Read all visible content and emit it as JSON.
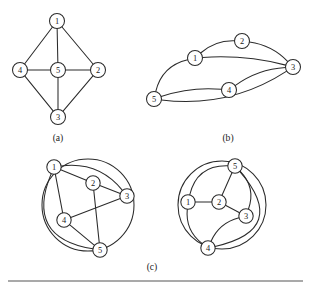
{
  "figure": {
    "background_color": "#ffffff",
    "ink_color": "#2b2b2b",
    "rule": {
      "x1": 8,
      "y1": 281,
      "x2": 303,
      "y2": 281,
      "color": "#555555"
    },
    "captions": [
      {
        "id": "caption-a",
        "text": "(a)",
        "x": 58,
        "y": 137
      },
      {
        "id": "caption-b",
        "text": "(b)",
        "x": 228,
        "y": 137
      },
      {
        "id": "caption-c",
        "text": "(c)",
        "x": 152,
        "y": 266
      }
    ],
    "graphs": [
      {
        "id": "graph-a",
        "caption": "(a)",
        "layout": "planar-quadrilateral-with-center",
        "nodes": [
          {
            "label": "1",
            "x": 57,
            "y": 21,
            "r": 7.5
          },
          {
            "label": "2",
            "x": 98,
            "y": 70,
            "r": 7.5
          },
          {
            "label": "3",
            "x": 58,
            "y": 117,
            "r": 7.5
          },
          {
            "label": "4",
            "x": 20,
            "y": 70,
            "r": 7.5
          },
          {
            "label": "5",
            "x": 58,
            "y": 70,
            "r": 7.5
          }
        ],
        "edges": [
          {
            "from": "1",
            "to": "4",
            "curve": 0
          },
          {
            "from": "1",
            "to": "2",
            "curve": 0
          },
          {
            "from": "1",
            "to": "5",
            "curve": 0
          },
          {
            "from": "4",
            "to": "5",
            "curve": 0
          },
          {
            "from": "5",
            "to": "2",
            "curve": 0
          },
          {
            "from": "4",
            "to": "3",
            "curve": 0
          },
          {
            "from": "5",
            "to": "3",
            "curve": 0
          },
          {
            "from": "3",
            "to": "2",
            "curve": 0
          }
        ]
      },
      {
        "id": "graph-b",
        "caption": "(b)",
        "layout": "lens-multiarc",
        "nodes": [
          {
            "label": "1",
            "x": 195,
            "y": 58,
            "r": 7.5
          },
          {
            "label": "2",
            "x": 242,
            "y": 41,
            "r": 7.5
          },
          {
            "label": "3",
            "x": 293,
            "y": 67,
            "r": 7.5
          },
          {
            "label": "4",
            "x": 229,
            "y": 90,
            "r": 7.5
          },
          {
            "label": "5",
            "x": 154,
            "y": 99,
            "r": 7.5
          }
        ],
        "edges": [
          {
            "from": "5",
            "to": "1",
            "curve": -9
          },
          {
            "from": "1",
            "to": "2",
            "curve": -5
          },
          {
            "from": "2",
            "to": "3",
            "curve": -5
          },
          {
            "from": "1",
            "to": "3",
            "curve": -4
          },
          {
            "from": "5",
            "to": "4",
            "curve": -4
          },
          {
            "from": "4",
            "to": "3",
            "curve": -5
          },
          {
            "from": "5",
            "to": "3",
            "curve": 13
          }
        ]
      },
      {
        "id": "graph-c-left",
        "caption": "(c)",
        "layout": "circular-embedding",
        "ring": {
          "cx": 88,
          "cy": 205,
          "r": 46
        },
        "nodes": [
          {
            "label": "1",
            "x": 54,
            "y": 167,
            "r": 7.2
          },
          {
            "label": "2",
            "x": 93,
            "y": 183,
            "r": 7.2
          },
          {
            "label": "3",
            "x": 127,
            "y": 196,
            "r": 7.2
          },
          {
            "label": "4",
            "x": 64,
            "y": 220,
            "r": 7.2
          },
          {
            "label": "5",
            "x": 100,
            "y": 250,
            "r": 7.2
          }
        ],
        "edges": [
          {
            "from": "1",
            "to": "2",
            "curve": 0
          },
          {
            "from": "2",
            "to": "3",
            "curve": 0
          },
          {
            "from": "2",
            "to": "5",
            "curve": 0
          },
          {
            "from": "1",
            "to": "4",
            "curve": 0
          },
          {
            "from": "3",
            "to": "4",
            "curve": 0
          },
          {
            "from": "4",
            "to": "5",
            "curve": 0
          },
          {
            "from": "1",
            "to": "3",
            "curve": -11
          },
          {
            "from": "1",
            "to": "5",
            "curve": 30
          }
        ]
      },
      {
        "id": "graph-c-right",
        "caption": "(c)",
        "layout": "circular-embedding",
        "ring": {
          "cx": 222,
          "cy": 205,
          "r": 44
        },
        "nodes": [
          {
            "label": "1",
            "x": 188,
            "y": 202,
            "r": 7.2
          },
          {
            "label": "2",
            "x": 219,
            "y": 202,
            "r": 7.2
          },
          {
            "label": "3",
            "x": 246,
            "y": 216,
            "r": 7.2
          },
          {
            "label": "4",
            "x": 208,
            "y": 248,
            "r": 7.2
          },
          {
            "label": "5",
            "x": 235,
            "y": 166,
            "r": 7.2
          }
        ],
        "edges": [
          {
            "from": "1",
            "to": "2",
            "curve": 0
          },
          {
            "from": "2",
            "to": "3",
            "curve": 0
          },
          {
            "from": "2",
            "to": "5",
            "curve": 0
          },
          {
            "from": "1",
            "to": "5",
            "curve": -12
          },
          {
            "from": "1",
            "to": "4",
            "curve": 7
          },
          {
            "from": "5",
            "to": "3",
            "curve": -8
          },
          {
            "from": "3",
            "to": "4",
            "curve": 6
          },
          {
            "from": "4",
            "to": "5",
            "curve": 36
          }
        ]
      }
    ]
  }
}
